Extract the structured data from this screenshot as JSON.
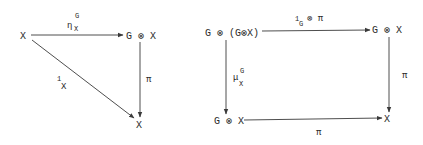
{
  "diagrams": [
    {
      "name": "unit-triangle",
      "nodes": {
        "top_left": "X",
        "top_right": "G ⊗ X",
        "bottom_right": "X"
      },
      "arrows": {
        "top": {
          "main": "η",
          "sub": "X",
          "sup": "G"
        },
        "diagonal": {
          "main": "1",
          "sub": "X"
        },
        "right": {
          "main": "π"
        }
      }
    },
    {
      "name": "associativity-square",
      "nodes": {
        "top_left": "G ⊗ (G⊗X)",
        "top_right": "G ⊗ X",
        "bottom_left": "G ⊗ X",
        "bottom_right": "X"
      },
      "arrows": {
        "top": {
          "main": "1",
          "sub": "G",
          "rest": "⊗ π"
        },
        "left": {
          "main": "μ",
          "sub": "X",
          "sup": "G"
        },
        "right": {
          "main": "π"
        },
        "bottom": {
          "main": "π"
        }
      }
    }
  ]
}
